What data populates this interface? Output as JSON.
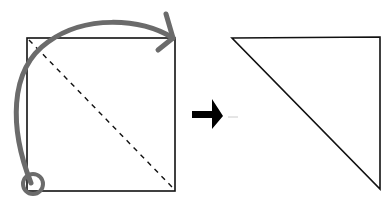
{
  "diagram": {
    "type": "folding-instruction",
    "steps": [
      {
        "name": "square-before-fold",
        "shape": "square",
        "fold_line": "diagonal (top-left to bottom-right), dashed",
        "marked_corner": "bottom-left (circled)",
        "fold_direction": "bottom-left corner folds up to top-right corner"
      },
      {
        "name": "triangle-after-fold",
        "shape": "right triangle",
        "right_angle_corner": "top-right"
      }
    ],
    "transition": "arrow-right"
  },
  "colors": {
    "outline": "#111111",
    "fold_arrow": "#6b6b6b",
    "step_arrow": "#000000",
    "background": "#ffffff"
  }
}
